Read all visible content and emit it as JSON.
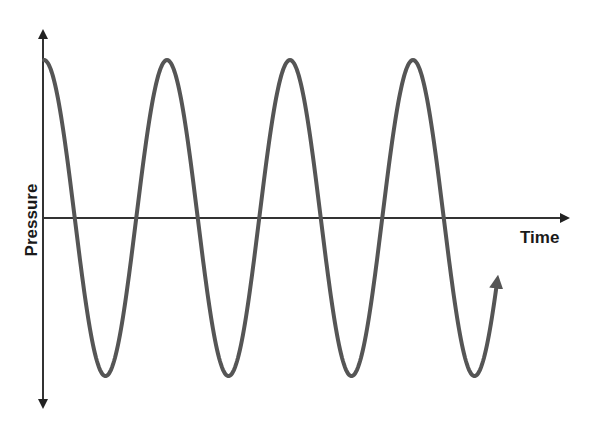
{
  "chart_data": {
    "type": "line",
    "title": "",
    "xlabel": "Time",
    "ylabel": "Pressure",
    "grid": false,
    "legend": null,
    "series": [
      {
        "name": "Pressure wave",
        "color": "#555555",
        "waveform": "cosine",
        "cycles": 3.75,
        "amplitude": 1,
        "peaks_x_px": [
          44,
          167,
          290,
          412
        ],
        "troughs_x_px": [
          107,
          230,
          353,
          475
        ]
      }
    ],
    "x_axis_y_px": 218,
    "peak_y_px": 60,
    "trough_y_px": 376,
    "period_px": 123
  },
  "labels": {
    "x_axis": "Time",
    "y_axis": "Pressure"
  },
  "colors": {
    "axis": "#333333",
    "wave": "#555555",
    "text": "#1a1a1a"
  }
}
